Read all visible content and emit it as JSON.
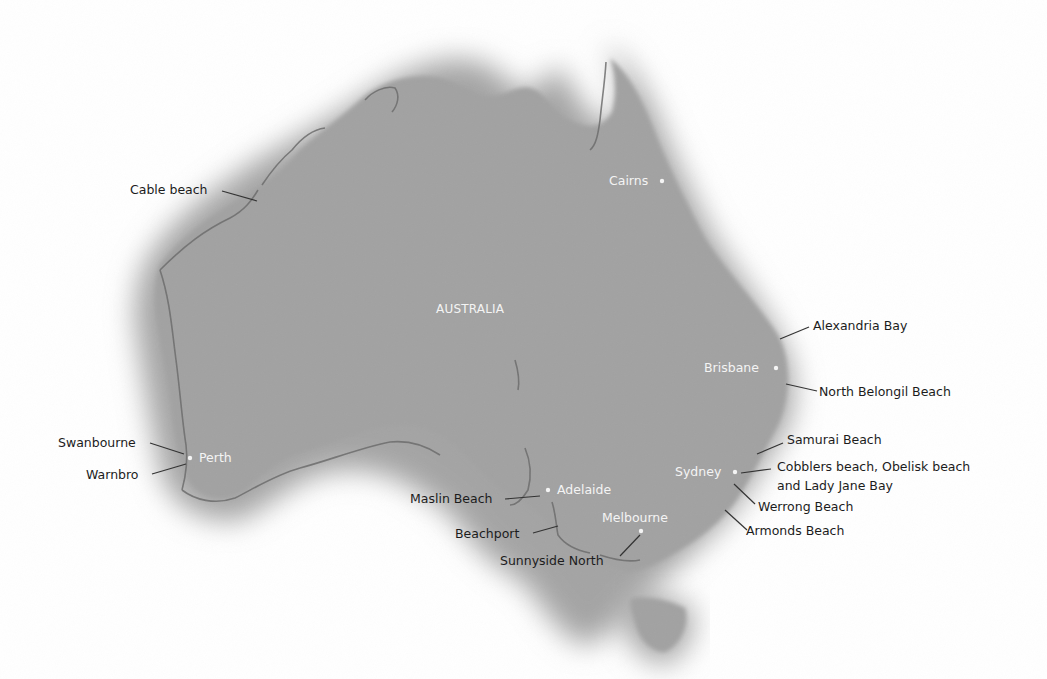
{
  "map": {
    "country_label": "AUSTRALIA",
    "colors": {
      "background": "#ffffff",
      "land": "#a2a2a2",
      "land_halo": "#9a9a9a",
      "coast_detail": "#6f6f6f",
      "beach_label": "#1c1c1c",
      "city_label": "#f4f4f4",
      "leader_line": "#333333"
    },
    "cities": [
      {
        "name": "Cairns",
        "dot": [
          662,
          181
        ]
      },
      {
        "name": "Brisbane",
        "dot": [
          776,
          368
        ]
      },
      {
        "name": "Perth",
        "dot": [
          190,
          458
        ]
      },
      {
        "name": "Adelaide",
        "dot": [
          548,
          490
        ]
      },
      {
        "name": "Sydney",
        "dot": [
          735,
          472
        ]
      },
      {
        "name": "Melbourne",
        "dot": [
          641,
          531
        ]
      }
    ],
    "beaches": [
      {
        "name": "Cable beach"
      },
      {
        "name": "Alexandria Bay"
      },
      {
        "name": "North Belongil Beach"
      },
      {
        "name": "Swanbourne"
      },
      {
        "name": "Warnbro"
      },
      {
        "name": "Samurai Beach"
      },
      {
        "name": "Cobblers beach, Obelisk beach"
      },
      {
        "name": "and Lady Jane Bay"
      },
      {
        "name": "Werrong Beach"
      },
      {
        "name": "Maslin Beach"
      },
      {
        "name": "Beachport"
      },
      {
        "name": "Armonds Beach"
      },
      {
        "name": "Sunnyside North"
      }
    ]
  }
}
